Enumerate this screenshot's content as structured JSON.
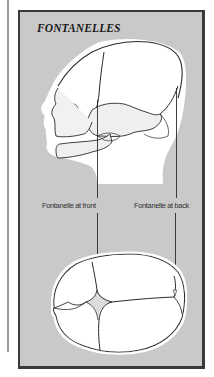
{
  "figure": {
    "title": "FONTANELLES",
    "views": [
      {
        "name": "side-view",
        "description": "Infant skull, lateral view"
      },
      {
        "name": "top-view",
        "description": "Infant skull, superior view"
      }
    ],
    "labels": {
      "front": "Fontanelle at front",
      "back": "Fontanelle at back"
    },
    "colors": {
      "panel_background": "#c9c9c9",
      "panel_border": "#3a3a3a",
      "skull_fill": "#ffffff",
      "line": "#2a2a2a",
      "margin_rule": "#9a9a9a"
    }
  }
}
